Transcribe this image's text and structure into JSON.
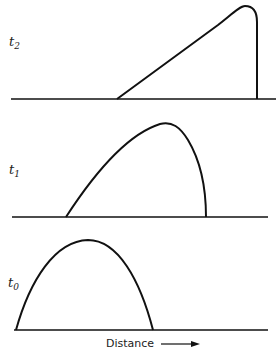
{
  "diagram": {
    "panels": [
      {
        "id": "t2",
        "label": "t",
        "subscript": "2"
      },
      {
        "id": "t1",
        "label": "t",
        "subscript": "1"
      },
      {
        "id": "t0",
        "label": "t",
        "subscript": "0"
      }
    ],
    "x_axis_label": "Distance",
    "arrow_icon": "right-arrow-icon",
    "colors": {
      "line": "#111111",
      "background": "#ffffff"
    }
  }
}
